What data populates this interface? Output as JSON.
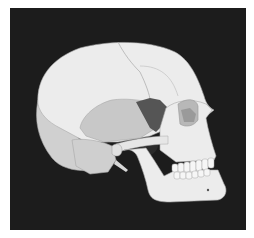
{
  "image": {
    "subject": "Lateral view of human skull illustration",
    "background_color": "#1c1c1c",
    "border_color": "#ffffff",
    "colors": {
      "bone_light": "#ececec",
      "bone_mid": "#d2d2d2",
      "temporal": "#c6c6c6",
      "sphenoid": "#555555",
      "orbit_inner": "#9a9a9a",
      "outline": "#a8a8a8",
      "dark_cavity": "#2a2a2a"
    }
  }
}
